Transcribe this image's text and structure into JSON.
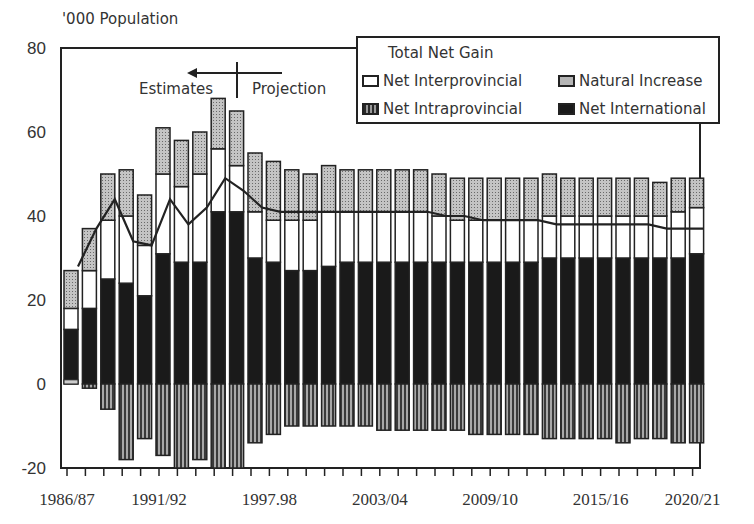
{
  "chart_data": {
    "type": "bar",
    "stacked": true,
    "title": "",
    "ylabel": "'000 Population",
    "xlabel": "",
    "ylim": [
      -20,
      80
    ],
    "yticks": [
      -20,
      0,
      20,
      40,
      60,
      80
    ],
    "grid": false,
    "legend_position": "top-right",
    "categories": [
      "1986/87",
      "1987/88",
      "1988/89",
      "1989/90",
      "1990/91",
      "1991/92",
      "1992/93",
      "1993/94",
      "1994/95",
      "1995/96",
      "1996/97",
      "1997/98",
      "1998/99",
      "1999/00",
      "2000/01",
      "2001/02",
      "2002/03",
      "2003/04",
      "2004/05",
      "2005/06",
      "2006/07",
      "2007/08",
      "2008/09",
      "2009/10",
      "2010/11",
      "2011/12",
      "2012/13",
      "2013/14",
      "2014/15",
      "2015/16",
      "2016/17",
      "2017/18",
      "2018/19",
      "2019/20",
      "2020/21"
    ],
    "xtick_labels": [
      "1986/87",
      "1991/92",
      "1997.98",
      "2003/04",
      "2009/10",
      "2015/16",
      "2020/21"
    ],
    "series": [
      {
        "name": "Net International",
        "fill": "black",
        "values": [
          13,
          18,
          25,
          24,
          21,
          31,
          29,
          29,
          41,
          41,
          30,
          29,
          27,
          27,
          28,
          29,
          29,
          29,
          29,
          29,
          29,
          29,
          29,
          29,
          29,
          29,
          30,
          30,
          30,
          30,
          30,
          30,
          30,
          30,
          31
        ]
      },
      {
        "name": "Net Interprovincial",
        "fill": "white",
        "values": [
          5,
          9,
          14,
          16,
          12,
          19,
          18,
          21,
          15,
          11,
          11,
          10,
          12,
          12,
          13,
          12,
          12,
          12,
          12,
          12,
          11,
          10,
          10,
          10,
          10,
          10,
          10,
          10,
          10,
          10,
          10,
          10,
          10,
          11,
          11
        ]
      },
      {
        "name": "Natural Increase",
        "fill": "light-gray",
        "values": [
          9,
          10,
          11,
          11,
          12,
          11,
          11,
          10,
          12,
          13,
          14,
          14,
          12,
          11,
          11,
          10,
          10,
          10,
          10,
          10,
          10,
          10,
          10,
          10,
          10,
          10,
          10,
          9,
          9,
          9,
          9,
          9,
          8,
          8,
          7
        ]
      },
      {
        "name": "Net Intraprovincial",
        "fill": "hatched",
        "values": [
          1,
          -1,
          -6,
          -18,
          -13,
          -17,
          -20,
          -18,
          -20,
          -20,
          -14,
          -12,
          -10,
          -10,
          -10,
          -10,
          -10,
          -11,
          -11,
          -11,
          -11,
          -11,
          -12,
          -12,
          -12,
          -12,
          -13,
          -13,
          -13,
          -13,
          -14,
          -13,
          -13,
          -14,
          -14
        ]
      },
      {
        "name": "Total Net Gain",
        "type": "line",
        "values": [
          28,
          37,
          44,
          34,
          33,
          44,
          38,
          42,
          49,
          46,
          42,
          41,
          41,
          41,
          41,
          41,
          41,
          41,
          41,
          41,
          40,
          40,
          39,
          39,
          39,
          39,
          38,
          38,
          38,
          38,
          38,
          38,
          37,
          37,
          37
        ]
      }
    ],
    "annotations": [
      {
        "text": "Estimates",
        "arrow": "left"
      },
      {
        "text": "Projection"
      }
    ]
  },
  "labels": {
    "y_title": "'000 Population",
    "estimates": "Estimates",
    "projection": "Projection",
    "yticks": [
      "80",
      "60",
      "40",
      "20",
      "0",
      "-20"
    ],
    "xticks": [
      "1986/87",
      "1991/92",
      "1997.98",
      "2003/04",
      "2009/10",
      "2015/16",
      "2020/21"
    ]
  },
  "legend": {
    "title": "Total Net Gain",
    "items": [
      {
        "label": "Net Interprovincial",
        "swatch": "white"
      },
      {
        "label": "Natural Increase",
        "swatch": "gray"
      },
      {
        "label": "Net Intraprovincial",
        "swatch": "hatch"
      },
      {
        "label": "Net International",
        "swatch": "black"
      }
    ]
  }
}
